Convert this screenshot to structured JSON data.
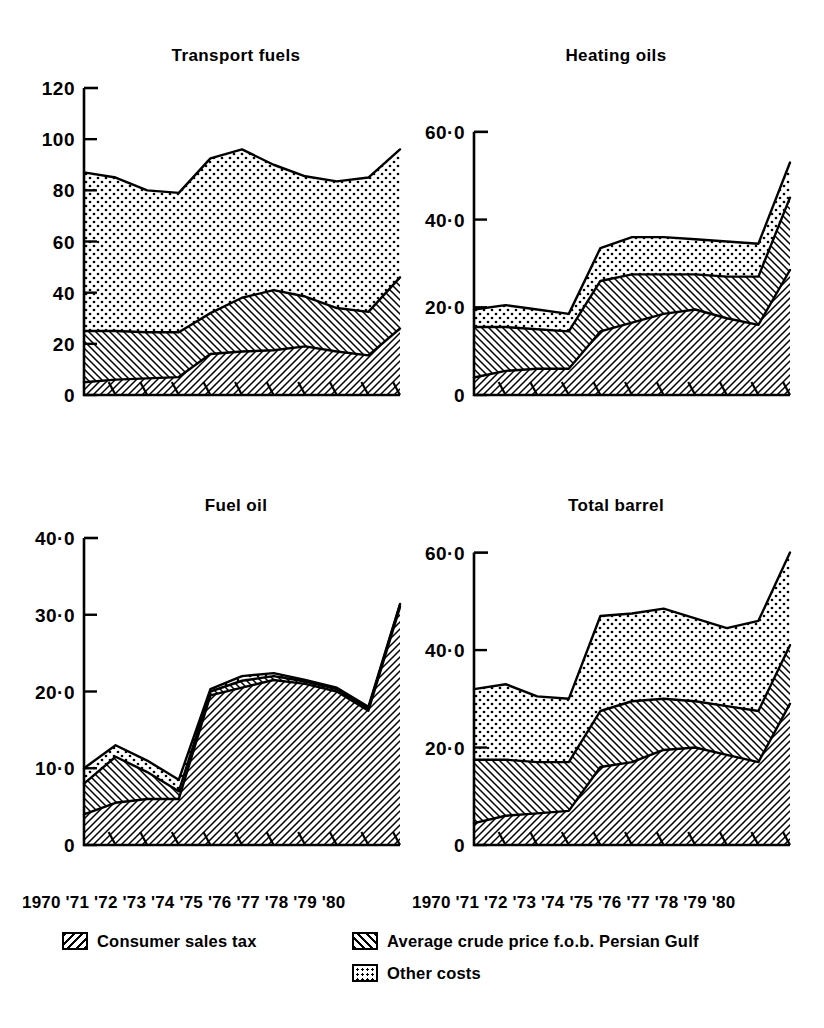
{
  "figure": {
    "panel_order": [
      "transport_fuels",
      "heating_oils",
      "fuel_oil",
      "total_barrel"
    ]
  },
  "legend": {
    "items": [
      {
        "key": "tax",
        "label": "Consumer sales tax",
        "pattern": "back-hatch"
      },
      {
        "key": "crude",
        "label": "Average crude price f.o.b. Persian Gulf",
        "pattern": "fwd-hatch"
      },
      {
        "key": "other",
        "label": "Other costs",
        "pattern": "dots"
      }
    ]
  },
  "axis": {
    "x_tick_labels": [
      "1970",
      "'71",
      "'72",
      "'73",
      "'74",
      "'75",
      "'76",
      "'77",
      "'78",
      "'79",
      "'80"
    ],
    "x_label_text": "1970 '71 '72 '73 '74 '75 '76 '77 '78 '79 '80"
  },
  "chart_data": [
    {
      "id": "transport_fuels",
      "type": "area",
      "stacked": true,
      "title": "Transport fuels",
      "xlabel": "",
      "ylabel": "",
      "grid": false,
      "legend_position": "below-figure",
      "x": [
        "1970",
        "'71",
        "'72",
        "'73",
        "'74",
        "'75",
        "'76",
        "'77",
        "'78",
        "'79",
        "'80"
      ],
      "ylim": [
        0,
        120
      ],
      "yticks": [
        0,
        20,
        40,
        60,
        80,
        100,
        120
      ],
      "ytick_labels": [
        "0",
        "20",
        "40",
        "60",
        "80",
        "100",
        "120"
      ],
      "series": [
        {
          "name": "Average crude price f.o.b. Persian Gulf",
          "key": "crude",
          "pattern": "fwd-hatch",
          "values": [
            5,
            6,
            6.5,
            7,
            16,
            17,
            17.5,
            19,
            17,
            15.5,
            26
          ]
        },
        {
          "name": "Consumer sales tax",
          "key": "tax",
          "pattern": "back-hatch",
          "values": [
            20,
            19,
            18,
            17.5,
            16,
            21,
            23.5,
            19.5,
            17,
            17,
            20
          ]
        },
        {
          "name": "Other costs",
          "key": "other",
          "pattern": "dots",
          "values": [
            62,
            60,
            55.5,
            54.5,
            60.5,
            58,
            49,
            47,
            49.5,
            52.5,
            50
          ]
        }
      ],
      "cumulative_tops": {
        "crude": [
          5,
          6,
          6.5,
          7,
          16,
          17,
          17.5,
          19,
          17,
          15.5,
          26
        ],
        "tax": [
          25,
          25,
          24.5,
          24.5,
          32,
          38,
          41,
          38.5,
          34,
          32.5,
          46
        ],
        "other": [
          87,
          85,
          80,
          79,
          92.5,
          96,
          90,
          85.5,
          83.5,
          85,
          96
        ]
      }
    },
    {
      "id": "heating_oils",
      "type": "area",
      "stacked": true,
      "title": "Heating oils",
      "xlabel": "",
      "ylabel": "",
      "grid": false,
      "legend_position": "below-figure",
      "x": [
        "1970",
        "'71",
        "'72",
        "'73",
        "'74",
        "'75",
        "'76",
        "'77",
        "'78",
        "'79",
        "'80"
      ],
      "ylim": [
        0,
        70
      ],
      "yticks": [
        0,
        20,
        40,
        60
      ],
      "ytick_labels": [
        "0",
        "20·0",
        "40·0",
        "60·0"
      ],
      "series": [
        {
          "name": "Average crude price f.o.b. Persian Gulf",
          "key": "crude",
          "pattern": "fwd-hatch",
          "values": [
            4.0,
            5.5,
            6.0,
            6.0,
            14.5,
            16.5,
            18.5,
            19.5,
            17.5,
            16.0,
            28.5
          ]
        },
        {
          "name": "Consumer sales tax",
          "key": "tax",
          "pattern": "back-hatch",
          "values": [
            11.5,
            10.0,
            9.0,
            8.5,
            11.5,
            11.0,
            9.0,
            8.0,
            9.5,
            11.0,
            16.5
          ]
        },
        {
          "name": "Other costs",
          "key": "other",
          "pattern": "dots",
          "values": [
            4.0,
            5.0,
            4.5,
            4.0,
            7.5,
            8.5,
            8.5,
            8.0,
            8.0,
            7.5,
            8.0
          ]
        }
      ],
      "cumulative_tops": {
        "crude": [
          4.0,
          5.5,
          6.0,
          6.0,
          14.5,
          16.5,
          18.5,
          19.5,
          17.5,
          16.0,
          28.5
        ],
        "tax": [
          15.5,
          15.5,
          15.0,
          14.5,
          26.0,
          27.5,
          27.5,
          27.5,
          27.0,
          27.0,
          45.0
        ],
        "other": [
          19.5,
          20.5,
          19.5,
          18.5,
          33.5,
          36.0,
          36.0,
          35.5,
          35.0,
          34.5,
          53.0
        ]
      }
    },
    {
      "id": "fuel_oil",
      "type": "area",
      "stacked": true,
      "title": "Fuel oil",
      "xlabel": "",
      "ylabel": "",
      "grid": false,
      "legend_position": "below-figure",
      "x": [
        "1970",
        "'71",
        "'72",
        "'73",
        "'74",
        "'75",
        "'76",
        "'77",
        "'78",
        "'79",
        "'80"
      ],
      "ylim": [
        0,
        40
      ],
      "yticks": [
        0,
        10,
        20,
        30,
        40
      ],
      "ytick_labels": [
        "0",
        "10·0",
        "20·0",
        "30·0",
        "40·0"
      ],
      "series": [
        {
          "name": "Average crude price f.o.b. Persian Gulf",
          "key": "crude",
          "pattern": "fwd-hatch",
          "values": [
            4.0,
            5.5,
            6.0,
            6.0,
            19.5,
            20.5,
            21.5,
            21.0,
            20.0,
            17.5,
            31.0
          ]
        },
        {
          "name": "Consumer sales tax",
          "key": "tax",
          "pattern": "back-hatch",
          "values": [
            1.5,
            3.5,
            2.5,
            1.5,
            0.5,
            0.8,
            0.6,
            0.4,
            0.4,
            0.4,
            0.4
          ]
        },
        {
          "name": "Other costs",
          "key": "other",
          "pattern": "dots",
          "values": [
            4.5,
            4.5,
            2.0,
            1.5,
            0.5,
            0.7,
            0.4,
            0.3,
            0.3,
            0.3,
            0.2
          ]
        }
      ],
      "cumulative_tops": {
        "crude": [
          4.0,
          5.5,
          6.0,
          6.0,
          19.5,
          20.5,
          21.5,
          21.0,
          20.0,
          17.5,
          31.0
        ],
        "tax": [
          8.0,
          11.5,
          9.5,
          7.0,
          20.0,
          21.4,
          22.0,
          21.3,
          20.3,
          17.8,
          31.3
        ],
        "other": [
          10.0,
          13.0,
          11.0,
          8.5,
          20.3,
          22.0,
          22.4,
          21.5,
          20.5,
          18.0,
          31.4
        ]
      }
    },
    {
      "id": "total_barrel",
      "type": "area",
      "stacked": true,
      "title": "Total barrel",
      "xlabel": "",
      "ylabel": "",
      "grid": false,
      "legend_position": "below-figure",
      "x": [
        "1970",
        "'71",
        "'72",
        "'73",
        "'74",
        "'75",
        "'76",
        "'77",
        "'78",
        "'79",
        "'80"
      ],
      "ylim": [
        0,
        63
      ],
      "yticks": [
        0,
        20,
        40,
        60
      ],
      "ytick_labels": [
        "0",
        "20·0",
        "40·0",
        "60·0"
      ],
      "series": [
        {
          "name": "Average crude price f.o.b. Persian Gulf",
          "key": "crude",
          "pattern": "fwd-hatch",
          "values": [
            4.5,
            6.0,
            6.5,
            7.0,
            16.0,
            17.0,
            19.5,
            20.0,
            18.5,
            17.0,
            29.0
          ]
        },
        {
          "name": "Consumer sales tax",
          "key": "tax",
          "pattern": "back-hatch",
          "values": [
            13.0,
            11.5,
            10.5,
            10.0,
            11.5,
            12.5,
            10.5,
            9.5,
            10.0,
            10.5,
            12.0
          ]
        },
        {
          "name": "Other costs",
          "key": "other",
          "pattern": "dots",
          "values": [
            14.5,
            15.5,
            13.5,
            13.0,
            19.5,
            18.0,
            18.5,
            17.0,
            16.0,
            18.5,
            19.0
          ]
        }
      ],
      "cumulative_tops": {
        "crude": [
          4.5,
          6.0,
          6.5,
          7.0,
          16.0,
          17.0,
          19.5,
          20.0,
          18.5,
          17.0,
          29.0
        ],
        "tax": [
          17.5,
          17.5,
          17.0,
          17.0,
          27.5,
          29.5,
          30.0,
          29.5,
          28.5,
          27.5,
          41.0
        ],
        "other": [
          32.0,
          33.0,
          30.5,
          30.0,
          47.0,
          47.5,
          48.5,
          46.5,
          44.5,
          46.0,
          60.0
        ]
      }
    }
  ]
}
